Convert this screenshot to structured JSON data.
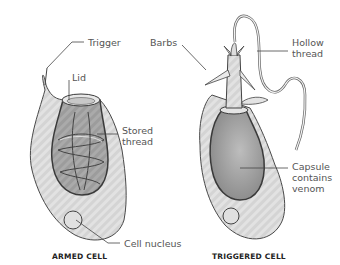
{
  "armed_cell": {
    "caption": "ARMED CELL",
    "labels": {
      "trigger": "Trigger",
      "lid": "Lid",
      "stored_thread_1": "Stored",
      "stored_thread_2": "thread",
      "cell_nucleus": "Cell nucleus"
    }
  },
  "triggered_cell": {
    "caption": "TRIGGERED CELL",
    "labels": {
      "barbs": "Barbs",
      "hollow_thread_1": "Hollow",
      "hollow_thread_2": "thread",
      "capsule_1": "Capsule",
      "capsule_2": "contains",
      "capsule_3": "venom"
    }
  },
  "colors": {
    "cell_fill": "#d6d6d6",
    "capsule_fill": "#9a9a9a",
    "outline": "#4a4a4a",
    "label_text": "#555555"
  }
}
